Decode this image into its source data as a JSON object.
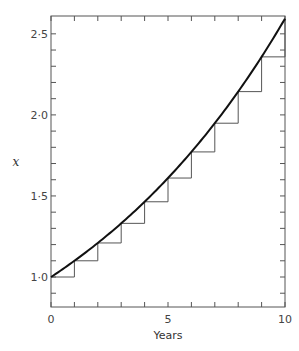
{
  "chart_data": {
    "type": "line",
    "title": "",
    "xlabel": "Years",
    "ylabel": "x",
    "xlim": [
      0,
      10
    ],
    "ylim": [
      0.815,
      2.61
    ],
    "grid": false,
    "x_ticks": [
      0,
      1,
      2,
      3,
      4,
      5,
      6,
      7,
      8,
      9,
      10
    ],
    "x_tick_labels": [
      {
        "value": 0,
        "label": "0"
      },
      {
        "value": 5,
        "label": "5"
      },
      {
        "value": 10,
        "label": "10"
      }
    ],
    "y_ticks": [
      0.9,
      1.0,
      1.1,
      1.2,
      1.3,
      1.4,
      1.5,
      1.6,
      1.7,
      1.8,
      1.9,
      2.0,
      2.1,
      2.2,
      2.3,
      2.4,
      2.5
    ],
    "y_tick_labels": [
      {
        "value": 1.0,
        "label": "1·0"
      },
      {
        "value": 1.5,
        "label": "1·5"
      },
      {
        "value": 2.0,
        "label": "2·0"
      },
      {
        "value": 2.5,
        "label": "2·5"
      }
    ],
    "series": [
      {
        "name": "continuous growth curve",
        "kind": "curve",
        "formula": "1.1^t",
        "x": [
          0,
          1,
          2,
          3,
          4,
          5,
          6,
          7,
          8,
          9,
          10
        ],
        "values": [
          1.0,
          1.1,
          1.21,
          1.331,
          1.4641,
          1.6105,
          1.7716,
          1.9487,
          2.1436,
          2.3579,
          2.5937
        ]
      },
      {
        "name": "annual step growth",
        "kind": "step",
        "x": [
          0,
          1,
          2,
          3,
          4,
          5,
          6,
          7,
          8,
          9
        ],
        "values": [
          1.0,
          1.1,
          1.21,
          1.331,
          1.4641,
          1.6105,
          1.7716,
          1.9487,
          2.1436,
          2.3579
        ]
      }
    ]
  }
}
